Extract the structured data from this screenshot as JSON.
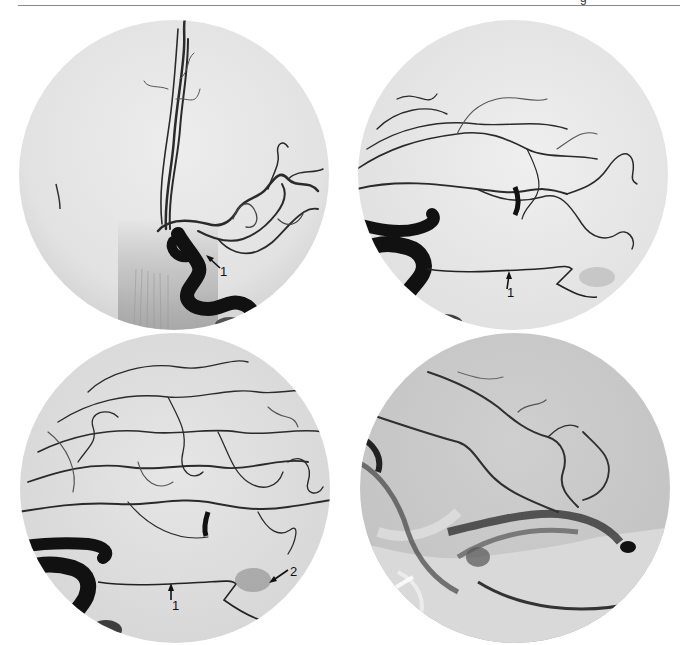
{
  "page": {
    "header_fragment": "g",
    "rule_color": "#8a8a8a"
  },
  "figure": {
    "type": "angiogram-panel-grid",
    "layout": "2x2",
    "panels": [
      {
        "id": "top-left",
        "view": "frontal (AP) angiogram",
        "annotations": [
          {
            "label": "1",
            "arrow_direction": "up-left"
          }
        ]
      },
      {
        "id": "top-right",
        "view": "lateral angiogram, arterial phase",
        "annotations": [
          {
            "label": "1",
            "arrow_direction": "up"
          }
        ]
      },
      {
        "id": "bottom-left",
        "view": "lateral angiogram, late arterial phase",
        "annotations": [
          {
            "label": "1",
            "arrow_direction": "up"
          },
          {
            "label": "2",
            "arrow_direction": "down-left"
          }
        ]
      },
      {
        "id": "bottom-right",
        "view": "lateral angiogram, venous phase",
        "annotations": []
      }
    ]
  },
  "colors": {
    "background": "#ffffff",
    "film_light": "#ededed",
    "film_mid": "#c9c9c9",
    "vessel": "#1a1a1a"
  }
}
